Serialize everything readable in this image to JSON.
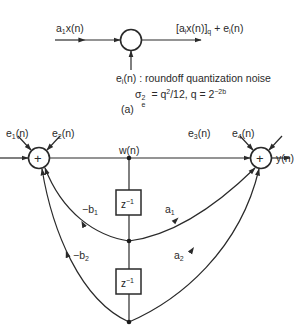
{
  "figure_a": {
    "input_label": "a1x(n)",
    "input_label_parts": {
      "base": "a",
      "sub": "1",
      "rest": "x(n)"
    },
    "output_label_parts": {
      "pre": "[a",
      "sub_i": "i",
      "mid": "x(n)]",
      "sub_q": "q",
      "plus": " + e",
      "sub_e": "i",
      "post": "(n)"
    },
    "noise_label_parts": {
      "base": "e",
      "sub": "i",
      "rest": "(n) : roundoff quantization noise"
    },
    "variance_parts": {
      "sigma": "σ",
      "sup": "2",
      "sub": "e",
      "eq": " = q",
      "qsup": "2",
      "rest": "/12, q = 2",
      "exp": "−2b"
    },
    "caption": "(a)"
  },
  "figure_b": {
    "noise_inputs": [
      {
        "base": "e",
        "sub": "1",
        "rest": "(n)"
      },
      {
        "base": "e",
        "sub": "2",
        "rest": "(n)"
      },
      {
        "base": "e",
        "sub": "3",
        "rest": "(n)"
      },
      {
        "base": "e",
        "sub": "4",
        "rest": "(n)"
      }
    ],
    "node_label": "w(n)",
    "output_label": "y(n)",
    "adder_symbol": "+",
    "delay": {
      "base": "z",
      "exp": "−1"
    },
    "coefficients": {
      "neg_b1": {
        "base": "−b",
        "sub": "1"
      },
      "a1": {
        "base": "a",
        "sub": "1"
      },
      "neg_b2": {
        "base": "−b",
        "sub": "2"
      },
      "a2": {
        "base": "a",
        "sub": "2"
      }
    }
  },
  "colors": {
    "line": "#2a2a2a",
    "background": "#ffffff"
  }
}
